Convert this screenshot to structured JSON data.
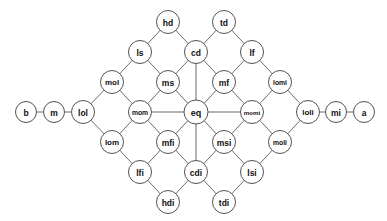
{
  "diagram": {
    "type": "lattice-graph",
    "title": "",
    "node_radius": 11.5,
    "chain_node_radius": 10.5,
    "colors": {
      "background": "#ffffff",
      "node_fill": "#ffffff",
      "node_stroke": "#404043",
      "edge_stroke": "#59595b",
      "label_color": "#0f0f10"
    },
    "nodes": [
      {
        "id": "b",
        "label": "b",
        "x": 26,
        "y": 112,
        "r": 10.5,
        "font_size": 8.5
      },
      {
        "id": "m",
        "label": "m",
        "x": 54,
        "y": 112,
        "r": 10.5,
        "font_size": 8.5
      },
      {
        "id": "lol",
        "label": "lol",
        "x": 83,
        "y": 112,
        "r": 11.5,
        "font_size": 8.5
      },
      {
        "id": "mol",
        "label": "mol",
        "x": 112,
        "y": 82,
        "r": 11.5,
        "font_size": 8
      },
      {
        "id": "lom",
        "label": "lom",
        "x": 112,
        "y": 142,
        "r": 11.5,
        "font_size": 8
      },
      {
        "id": "ls",
        "label": "ls",
        "x": 140,
        "y": 52,
        "r": 11.5,
        "font_size": 8.5
      },
      {
        "id": "mom",
        "label": "mom",
        "x": 140,
        "y": 112,
        "r": 11.5,
        "font_size": 6.8
      },
      {
        "id": "lfi",
        "label": "lfi",
        "x": 140,
        "y": 172,
        "r": 11.5,
        "font_size": 8.5
      },
      {
        "id": "hd",
        "label": "hd",
        "x": 168,
        "y": 22,
        "r": 11.5,
        "font_size": 8.5
      },
      {
        "id": "ms",
        "label": "ms",
        "x": 168,
        "y": 82,
        "r": 11.5,
        "font_size": 8.5
      },
      {
        "id": "mfi",
        "label": "mfi",
        "x": 168,
        "y": 142,
        "r": 11.5,
        "font_size": 8.5
      },
      {
        "id": "hdi",
        "label": "hdi",
        "x": 168,
        "y": 202,
        "r": 11.5,
        "font_size": 8.5
      },
      {
        "id": "cd",
        "label": "cd",
        "x": 196,
        "y": 52,
        "r": 11.5,
        "font_size": 8.5
      },
      {
        "id": "eq",
        "label": "eq",
        "x": 196,
        "y": 112,
        "r": 12,
        "font_size": 9
      },
      {
        "id": "cdi",
        "label": "cdi",
        "x": 196,
        "y": 172,
        "r": 11.5,
        "font_size": 8.5
      },
      {
        "id": "td",
        "label": "td",
        "x": 224,
        "y": 22,
        "r": 11.5,
        "font_size": 8.5
      },
      {
        "id": "mf",
        "label": "mf",
        "x": 224,
        "y": 82,
        "r": 11.5,
        "font_size": 8.5
      },
      {
        "id": "msi",
        "label": "msi",
        "x": 224,
        "y": 142,
        "r": 11.5,
        "font_size": 8.5
      },
      {
        "id": "tdi",
        "label": "tdi",
        "x": 224,
        "y": 202,
        "r": 11.5,
        "font_size": 8.5
      },
      {
        "id": "lf",
        "label": "lf",
        "x": 252,
        "y": 52,
        "r": 11.5,
        "font_size": 8.5
      },
      {
        "id": "momi",
        "label": "momi",
        "x": 252,
        "y": 112,
        "r": 11.5,
        "font_size": 6.2
      },
      {
        "id": "lsi",
        "label": "lsi",
        "x": 252,
        "y": 172,
        "r": 11.5,
        "font_size": 8.5
      },
      {
        "id": "lomi",
        "label": "lomi",
        "x": 280,
        "y": 82,
        "r": 11.5,
        "font_size": 6.8
      },
      {
        "id": "moli",
        "label": "moli",
        "x": 280,
        "y": 142,
        "r": 11.5,
        "font_size": 6.8
      },
      {
        "id": "loli",
        "label": "loli",
        "x": 308,
        "y": 112,
        "r": 11.5,
        "font_size": 8
      },
      {
        "id": "mi",
        "label": "mi",
        "x": 336,
        "y": 112,
        "r": 10.5,
        "font_size": 8.5
      },
      {
        "id": "a",
        "label": "a",
        "x": 364,
        "y": 112,
        "r": 10.5,
        "font_size": 8.5
      }
    ],
    "edges": [
      [
        "b",
        "m"
      ],
      [
        "m",
        "lol"
      ],
      [
        "lol",
        "mol"
      ],
      [
        "lol",
        "lom"
      ],
      [
        "mol",
        "ls"
      ],
      [
        "mol",
        "mom"
      ],
      [
        "lom",
        "mom"
      ],
      [
        "lom",
        "lfi"
      ],
      [
        "ls",
        "hd"
      ],
      [
        "ls",
        "ms"
      ],
      [
        "mom",
        "ms"
      ],
      [
        "mom",
        "mfi"
      ],
      [
        "mom",
        "eq"
      ],
      [
        "lfi",
        "mfi"
      ],
      [
        "lfi",
        "hdi"
      ],
      [
        "hd",
        "cd"
      ],
      [
        "ms",
        "cd"
      ],
      [
        "ms",
        "eq"
      ],
      [
        "mfi",
        "eq"
      ],
      [
        "mfi",
        "cdi"
      ],
      [
        "hdi",
        "cdi"
      ],
      [
        "cd",
        "td"
      ],
      [
        "cd",
        "mf"
      ],
      [
        "cd",
        "eq"
      ],
      [
        "eq",
        "mf"
      ],
      [
        "eq",
        "msi"
      ],
      [
        "eq",
        "cdi"
      ],
      [
        "eq",
        "momi"
      ],
      [
        "cdi",
        "msi"
      ],
      [
        "cdi",
        "tdi"
      ],
      [
        "td",
        "lf"
      ],
      [
        "mf",
        "lf"
      ],
      [
        "mf",
        "momi"
      ],
      [
        "msi",
        "momi"
      ],
      [
        "msi",
        "lsi"
      ],
      [
        "tdi",
        "lsi"
      ],
      [
        "lf",
        "lomi"
      ],
      [
        "momi",
        "lomi"
      ],
      [
        "momi",
        "moli"
      ],
      [
        "lsi",
        "moli"
      ],
      [
        "lomi",
        "loli"
      ],
      [
        "moli",
        "loli"
      ],
      [
        "loli",
        "mi"
      ],
      [
        "mi",
        "a"
      ]
    ]
  }
}
